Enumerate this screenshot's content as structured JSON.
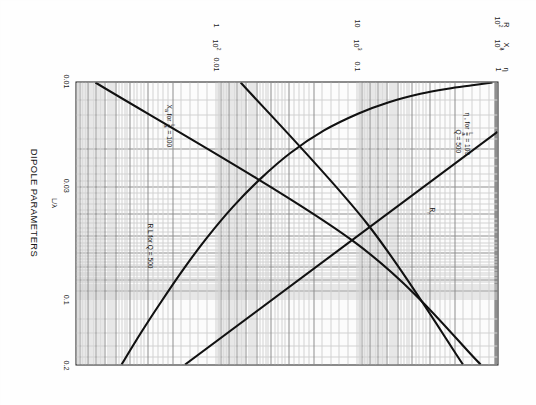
{
  "figure": {
    "title": "DIPOLE PARAMETERS",
    "xaxis_label": "L/λ"
  },
  "chart_data": {
    "type": "line",
    "title": "DIPOLE PARAMETERS",
    "xlabel": "L/λ",
    "ylabel": "",
    "xscale": "log",
    "yscale": "log",
    "xlim": [
      0.01,
      0.2
    ],
    "grid": true,
    "legend": "in-plot curve labels",
    "xticks": [
      "0.01",
      "0.03",
      "0.1",
      "0.2"
    ],
    "xtick_values": [
      0.01,
      0.03,
      0.1,
      0.2
    ],
    "y_scales": [
      {
        "name": "η",
        "head": "η",
        "ticks": [
          "1",
          "0.1",
          "0.01"
        ],
        "tick_values": [
          1,
          0.1,
          0.01
        ]
      },
      {
        "name": "X_a",
        "head": "X",
        "head_sub": "a",
        "ticks": [
          "10⁴",
          "10³",
          "10²"
        ],
        "tick_values": [
          10000,
          1000,
          100
        ]
      },
      {
        "name": "R",
        "head": "R",
        "ticks": [
          "10²",
          "10",
          "1"
        ],
        "tick_values": [
          100,
          10,
          1
        ]
      }
    ],
    "ytick_rows": [
      {
        "label_eta": "1",
        "label_xa": "10⁴",
        "label_r": "10²"
      },
      {
        "label_eta": "0.1",
        "label_xa": "10³",
        "label_r": "10"
      },
      {
        "label_eta": "0.01",
        "label_xa": "10²",
        "label_r": "1"
      }
    ],
    "series": [
      {
        "name": "η (efficiency)",
        "curve_label": "η , for",
        "curve_label_frac_num": "L",
        "curve_label_frac_den": "a",
        "curve_label_tail": "= 100",
        "curve_label_second": "Q = 500",
        "points_norm": [
          [
            0.0,
            0.012
          ],
          [
            0.01,
            0.06
          ],
          [
            0.022,
            0.118
          ],
          [
            0.04,
            0.183
          ],
          [
            0.07,
            0.258
          ],
          [
            0.11,
            0.33
          ],
          [
            0.17,
            0.412
          ],
          [
            0.25,
            0.492
          ],
          [
            0.34,
            0.562
          ],
          [
            0.44,
            0.628
          ],
          [
            0.55,
            0.69
          ],
          [
            0.66,
            0.745
          ],
          [
            0.78,
            0.8
          ],
          [
            0.89,
            0.848
          ],
          [
            1.0,
            0.893
          ]
        ],
        "description": "Efficiency eta falls steeply then flattens (plotted top-left to bottom-right)"
      },
      {
        "name": "R_r (radiation resistance)",
        "curve_label": "R",
        "curve_label_sub": "r",
        "points_norm": [
          [
            0.175,
            0.0
          ],
          [
            1.0,
            0.742
          ]
        ],
        "description": "Radiation resistance rises with L/lambda on log-log, slope ~2"
      },
      {
        "name": "X_a (reactance)",
        "curve_label": "X",
        "curve_label_sub": "a",
        "curve_label_mid": "for",
        "curve_label_frac_num": "L",
        "curve_label_frac_den": "a",
        "curve_label_tail": "= 100",
        "points_norm": [
          [
            0.0,
            0.955
          ],
          [
            0.56,
            0.345
          ],
          [
            1.0,
            0.04
          ]
        ],
        "description": "Reactance magnitude decreases as L/lambda increases"
      },
      {
        "name": "R_L (loss resistance)",
        "curve_label": "R L for Q = 500",
        "points_norm": [
          [
            0.0,
            0.61
          ],
          [
            0.5,
            0.31
          ],
          [
            1.0,
            0.082
          ]
        ],
        "description": "Loss resistance for Q = 500, gently decreasing on log-log"
      }
    ],
    "annotations": [
      {
        "id": "eta-label",
        "text": "η , for L/a = 100"
      },
      {
        "id": "q-label",
        "text": "Q = 500"
      },
      {
        "id": "xa-label",
        "text": "Xₐ for L/a = 100"
      },
      {
        "id": "rl-label",
        "text": "R L for Q = 500"
      },
      {
        "id": "rr-label",
        "text": "Rᵣ"
      }
    ]
  }
}
